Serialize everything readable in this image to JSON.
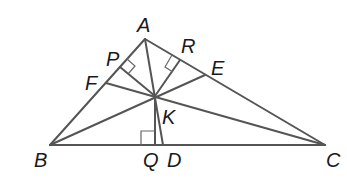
{
  "diagram": {
    "type": "triangle-with-cevians",
    "points": {
      "A": {
        "label": "A",
        "x": 145,
        "y": 39,
        "lx": 137,
        "ly": 32
      },
      "B": {
        "label": "B",
        "x": 50,
        "y": 145,
        "lx": 34,
        "ly": 167
      },
      "C": {
        "label": "C",
        "x": 325,
        "y": 145,
        "lx": 326,
        "ly": 167
      },
      "K": {
        "label": "K",
        "x": 155,
        "y": 96,
        "lx": 162,
        "ly": 124
      },
      "P": {
        "label": "P",
        "x": 120,
        "y": 67,
        "lx": 106,
        "ly": 66
      },
      "R": {
        "label": "R",
        "x": 180,
        "y": 60,
        "lx": 181,
        "ly": 53
      },
      "F": {
        "label": "F",
        "x": 106,
        "y": 83,
        "lx": 85,
        "ly": 90
      },
      "E": {
        "label": "E",
        "x": 205,
        "y": 75,
        "lx": 211,
        "ly": 75
      },
      "Q": {
        "label": "Q",
        "x": 155,
        "y": 145,
        "lx": 143,
        "ly": 167
      },
      "D": {
        "label": "D",
        "x": 163,
        "y": 145,
        "lx": 167,
        "ly": 167
      }
    },
    "segments": [
      [
        "A",
        "B"
      ],
      [
        "B",
        "C"
      ],
      [
        "C",
        "A"
      ],
      [
        "A",
        "K"
      ],
      [
        "K",
        "D"
      ],
      [
        "K",
        "P"
      ],
      [
        "K",
        "R"
      ],
      [
        "K",
        "Q"
      ],
      [
        "B",
        "E"
      ],
      [
        "C",
        "F"
      ]
    ],
    "right_angles": [
      {
        "at": "P",
        "desc": "KP perpendicular to AB"
      },
      {
        "at": "R",
        "desc": "KR perpendicular to AC"
      },
      {
        "at": "Q",
        "desc": "KQ perpendicular to BC"
      }
    ],
    "colors": {
      "stroke": "#555555",
      "label": "#1a1a1a",
      "background": "#ffffff"
    }
  }
}
